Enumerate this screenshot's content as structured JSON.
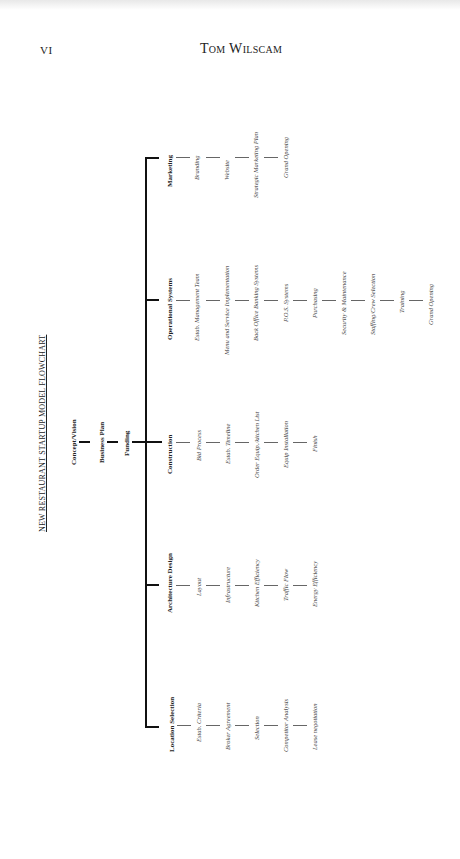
{
  "header": {
    "folio": "VI",
    "running_head": "Tom Wilscam"
  },
  "flowchart": {
    "title": "NEW RESTAURANT STARTUP MODEL   FLOWCHART",
    "root_chain": [
      "Concept/Vision",
      "Business Plan",
      "Funding"
    ],
    "branches": [
      {
        "label": "Marketing",
        "steps": [
          "Branding",
          "Website",
          "Strategic Marketing Plan",
          "Grand Opening"
        ]
      },
      {
        "label": "Operational Systems",
        "steps": [
          "Estab. Management Team",
          "Menu and Service Implementation",
          "Back Office Banking Systems",
          "P.O.S. Systems",
          "Purchasing",
          "Security & Maintenance",
          "Staffing/Crew Selection",
          "Training",
          "Grand Opening"
        ]
      },
      {
        "label": "Construction",
        "steps": [
          "Bid Process",
          "Estab. Timeline",
          "Order Equip./kitchen List",
          "Equip Installation",
          "Finish"
        ]
      },
      {
        "label": "Architecture Design",
        "steps": [
          "Layout",
          "Infrastructure",
          "Kitchen Efficiency",
          "Traffic Flow",
          "Energy Efficiency"
        ]
      },
      {
        "label": "Location Selection",
        "steps": [
          "Estab. Criteria",
          "Broker Agreement",
          "Selection",
          "Competitor Analysis",
          "Lease negotiation"
        ]
      }
    ]
  }
}
